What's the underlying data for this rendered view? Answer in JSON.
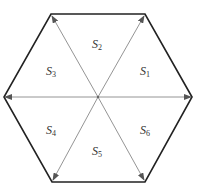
{
  "diagram": {
    "type": "hexagon-sector-diagram",
    "center": {
      "x": 98,
      "y": 97
    },
    "vertices": [
      {
        "name": "right",
        "x": 192,
        "y": 97
      },
      {
        "name": "top-right",
        "x": 145,
        "y": 14
      },
      {
        "name": "top-left",
        "x": 51,
        "y": 14
      },
      {
        "name": "left",
        "x": 4,
        "y": 97
      },
      {
        "name": "bottom-left",
        "x": 52,
        "y": 182
      },
      {
        "name": "bottom-right",
        "x": 145,
        "y": 182
      }
    ],
    "colors": {
      "outline": "#222222",
      "arrow": "#888888",
      "label": "#333333"
    },
    "sectors": [
      {
        "letter": "S",
        "index": "1",
        "x": 145,
        "y": 72
      },
      {
        "letter": "S",
        "index": "2",
        "x": 97,
        "y": 45
      },
      {
        "letter": "S",
        "index": "3",
        "x": 51,
        "y": 72
      },
      {
        "letter": "S",
        "index": "4",
        "x": 51,
        "y": 131
      },
      {
        "letter": "S",
        "index": "5",
        "x": 97,
        "y": 152
      },
      {
        "letter": "S",
        "index": "6",
        "x": 145,
        "y": 131
      }
    ]
  }
}
